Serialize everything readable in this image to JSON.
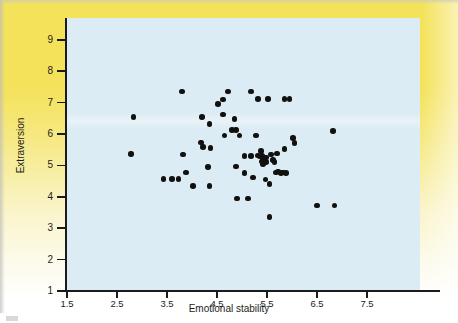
{
  "figure": {
    "background_color": "#f4e25a",
    "plot_background_color": "#dcecf4",
    "point_color": "#11110f",
    "axis_color": "#1b1b1b"
  },
  "chart_data": {
    "type": "scatter",
    "title": "",
    "xlabel": "Emotional stability",
    "ylabel": "Extraversion",
    "xlim": [
      1.5,
      8.3
    ],
    "ylim": [
      1,
      9.4
    ],
    "xticks": [
      "1.5",
      "2.5",
      "3.5",
      "4.5",
      "5.5",
      "6.5",
      "7.5"
    ],
    "xtick_values": [
      1.5,
      2.5,
      3.5,
      4.5,
      5.5,
      6.5,
      7.5
    ],
    "yticks": [
      "1",
      "2",
      "3",
      "4",
      "5",
      "6",
      "7",
      "8",
      "9"
    ],
    "ytick_values": [
      1,
      2,
      3,
      4,
      5,
      6,
      7,
      8,
      9
    ],
    "grid": false,
    "legend": false,
    "n_points": 66,
    "points": [
      [
        2.83,
        6.55
      ],
      [
        2.78,
        5.37
      ],
      [
        3.43,
        4.57
      ],
      [
        3.6,
        4.57
      ],
      [
        3.73,
        4.57
      ],
      [
        3.8,
        7.35
      ],
      [
        3.82,
        5.35
      ],
      [
        3.88,
        4.77
      ],
      [
        4.02,
        4.35
      ],
      [
        4.2,
        6.55
      ],
      [
        4.18,
        5.73
      ],
      [
        4.22,
        5.58
      ],
      [
        4.35,
        6.32
      ],
      [
        4.37,
        5.55
      ],
      [
        4.32,
        4.95
      ],
      [
        4.35,
        4.35
      ],
      [
        4.52,
        6.95
      ],
      [
        4.62,
        7.1
      ],
      [
        4.65,
        5.95
      ],
      [
        4.72,
        7.35
      ],
      [
        4.62,
        6.62
      ],
      [
        4.8,
        6.12
      ],
      [
        4.88,
        6.12
      ],
      [
        4.85,
        6.48
      ],
      [
        4.88,
        4.97
      ],
      [
        4.9,
        3.95
      ],
      [
        5.05,
        4.75
      ],
      [
        5.12,
        3.95
      ],
      [
        5.18,
        7.35
      ],
      [
        5.18,
        5.3
      ],
      [
        5.32,
        7.12
      ],
      [
        5.28,
        5.95
      ],
      [
        5.32,
        5.32
      ],
      [
        5.35,
        5.28
      ],
      [
        5.38,
        5.45
      ],
      [
        5.4,
        5.3
      ],
      [
        5.42,
        5.22
      ],
      [
        5.4,
        5.12
      ],
      [
        5.42,
        5.05
      ],
      [
        5.45,
        5.18
      ],
      [
        5.48,
        5.25
      ],
      [
        5.48,
        5.1
      ],
      [
        5.47,
        4.55
      ],
      [
        5.52,
        7.12
      ],
      [
        5.55,
        3.35
      ],
      [
        5.55,
        4.4
      ],
      [
        5.58,
        5.35
      ],
      [
        5.62,
        5.18
      ],
      [
        5.65,
        5.1
      ],
      [
        5.68,
        4.78
      ],
      [
        5.72,
        4.8
      ],
      [
        5.7,
        5.38
      ],
      [
        5.78,
        4.75
      ],
      [
        5.82,
        4.78
      ],
      [
        5.85,
        5.52
      ],
      [
        5.85,
        7.12
      ],
      [
        5.95,
        7.12
      ],
      [
        5.88,
        4.75
      ],
      [
        6.02,
        5.88
      ],
      [
        6.05,
        5.72
      ],
      [
        6.5,
        3.72
      ],
      [
        6.82,
        6.1
      ],
      [
        6.85,
        3.72
      ],
      [
        5.05,
        5.3
      ],
      [
        4.95,
        5.95
      ],
      [
        5.22,
        4.62
      ]
    ]
  }
}
